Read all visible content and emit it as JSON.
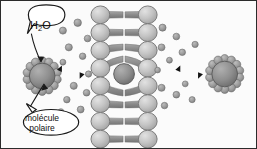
{
  "figure": {
    "background_color": "#fbfbfb",
    "border_color": "#2b2b2b",
    "width": 257,
    "height": 149
  },
  "labels": {
    "water": {
      "text_main": "H",
      "text_sub": "2",
      "text_tail": "O",
      "full": "H2O",
      "callout_target": "left-solvated-molecule"
    },
    "polar_molecule": {
      "line1": "molécule",
      "line2": "polaire",
      "full": "molécule polaire",
      "callout_target": "left-solvated-molecule"
    }
  },
  "colors": {
    "lipid_head_fill": "#bdbdbd",
    "lipid_head_stroke": "#7a7a7a",
    "lipid_tail": "#8c8c8c",
    "water_dot_fill": "#9a9a9a",
    "water_dot_stroke": "#6f6f6f",
    "solute_core_fill": "#8f8f8f",
    "solute_core_stroke": "#5e5e5e",
    "shell_dot_fill": "#a2a2a2",
    "arrow_color": "#141414",
    "callout_stroke": "#1a1a1a",
    "callout_fill": "#ffffff",
    "text_color": "#101010"
  },
  "elements": {
    "left_solvated_molecule": {
      "name": "molécule polaire hydratée (gauche)",
      "cx": 41,
      "cy": 76,
      "core_radius": 13,
      "shell_count": 14,
      "shell_radius": 4.2,
      "shell_orbit": 15.5
    },
    "right_solvated_molecule": {
      "name": "molécule polaire hydratée (droite)",
      "cx": 226,
      "cy": 74,
      "core_radius": 13,
      "shell_count": 14,
      "shell_radius": 4.2,
      "shell_orbit": 15.5
    },
    "membrane": {
      "name": "bicouche lipidique",
      "left_head_x": 100,
      "right_head_x": 148,
      "head_rx": 9.5,
      "head_ry": 9,
      "rows": 8,
      "row_spacing": 18,
      "first_row_y": 14,
      "transiting_solute": {
        "name": "molécule traversant la membrane",
        "cx": 124,
        "cy": 74,
        "radius": 10.5
      }
    },
    "arrows": {
      "left": {
        "name": "flèches d'équilibre (gauche)",
        "x": 56,
        "y": 70,
        "length": 28,
        "direction_top": "left",
        "direction_bottom": "right"
      },
      "right": {
        "name": "flèches d'équilibre (droite)",
        "x": 176,
        "y": 70,
        "length": 28,
        "direction_top": "left",
        "direction_bottom": "right"
      }
    },
    "water_dots_left": [
      {
        "cx": 62,
        "cy": 30,
        "r": 3.6
      },
      {
        "cx": 77,
        "cy": 22,
        "r": 3.8
      },
      {
        "cx": 87,
        "cy": 38,
        "r": 3.4
      },
      {
        "cx": 68,
        "cy": 47,
        "r": 3.6
      },
      {
        "cx": 82,
        "cy": 56,
        "r": 3.3
      },
      {
        "cx": 62,
        "cy": 62,
        "r": 3.0
      },
      {
        "cx": 73,
        "cy": 86,
        "r": 3.6
      },
      {
        "cx": 86,
        "cy": 93,
        "r": 3.4
      },
      {
        "cx": 66,
        "cy": 100,
        "r": 3.3
      },
      {
        "cx": 80,
        "cy": 110,
        "r": 3.5
      },
      {
        "cx": 88,
        "cy": 74,
        "r": 3.2
      },
      {
        "cx": 60,
        "cy": 112,
        "r": 2.9
      }
    ],
    "water_dots_right": [
      {
        "cx": 163,
        "cy": 27,
        "r": 3.6
      },
      {
        "cx": 177,
        "cy": 36,
        "r": 3.4
      },
      {
        "cx": 162,
        "cy": 47,
        "r": 3.5
      },
      {
        "cx": 183,
        "cy": 52,
        "r": 3.3
      },
      {
        "cx": 170,
        "cy": 60,
        "r": 3.0
      },
      {
        "cx": 196,
        "cy": 44,
        "r": 3.2
      },
      {
        "cx": 162,
        "cy": 88,
        "r": 3.6
      },
      {
        "cx": 177,
        "cy": 95,
        "r": 3.4
      },
      {
        "cx": 165,
        "cy": 106,
        "r": 3.3
      },
      {
        "cx": 186,
        "cy": 84,
        "r": 3.0
      },
      {
        "cx": 193,
        "cy": 100,
        "r": 3.1
      },
      {
        "cx": 158,
        "cy": 70,
        "r": 2.9
      }
    ]
  }
}
